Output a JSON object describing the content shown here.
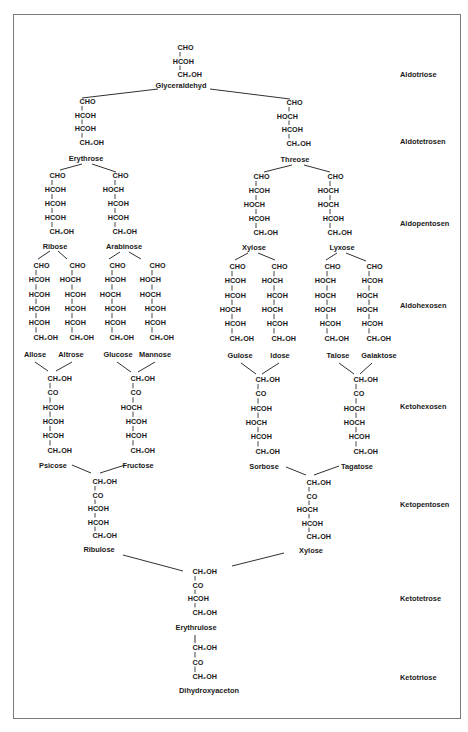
{
  "diagram": {
    "type": "sugar-family-tree",
    "row_labels": {
      "aldotriose": "Aldotriose",
      "aldotetrosen": "Aldotetrosen",
      "aldopentosen": "Aldopentosen",
      "aldohexosen": "Aldohexosen",
      "ketohexosen": "Ketohexosen",
      "ketopentosen": "Ketopentosen",
      "ketotetrose": "Ketotetrose",
      "ketotriose": "Ketotriose"
    },
    "sugars": {
      "glyceraldehyd": {
        "name": "Glyceraldehyd",
        "lines": [
          "CHO",
          "HCOH",
          "CH₂OH"
        ]
      },
      "erythrose": {
        "name": "Erythrose",
        "lines": [
          "CHO",
          "HCOH",
          "HCOH",
          "CH₂OH"
        ]
      },
      "threose": {
        "name": "Threose",
        "lines": [
          "CHO",
          "HOCH",
          "HCOH",
          "CH₂OH"
        ]
      },
      "ribose": {
        "name": "Ribose",
        "lines": [
          "CHO",
          "HCOH",
          "HCOH",
          "HCOH",
          "CH₂OH"
        ]
      },
      "arabinose": {
        "name": "Arabinose",
        "lines": [
          "CHO",
          "HOCH",
          "HCOH",
          "HCOH",
          "CH₂OH"
        ]
      },
      "xylose": {
        "name": "Xylose",
        "lines": [
          "CHO",
          "HCOH",
          "HOCH",
          "HCOH",
          "CH₂OH"
        ]
      },
      "lyxose": {
        "name": "Lyxose",
        "lines": [
          "CHO",
          "HOCH",
          "HOCH",
          "HCOH",
          "CH₂OH"
        ]
      },
      "allose": {
        "name": "Allose",
        "lines": [
          "CHO",
          "HCOH",
          "HCOH",
          "HCOH",
          "HCOH",
          "CH₂OH"
        ]
      },
      "altrose": {
        "name": "Altrose",
        "lines": [
          "CHO",
          "HOCH",
          "HCOH",
          "HCOH",
          "HCOH",
          "CH₂OH"
        ]
      },
      "glucose": {
        "name": "Glucose",
        "lines": [
          "CHO",
          "HCOH",
          "HOCH",
          "HCOH",
          "HCOH",
          "CH₂OH"
        ]
      },
      "mannose": {
        "name": "Mannose",
        "lines": [
          "CHO",
          "HOCH",
          "HOCH",
          "HCOH",
          "HCOH",
          "CH₂OH"
        ]
      },
      "gulose": {
        "name": "Gulose",
        "lines": [
          "CHO",
          "HCOH",
          "HCOH",
          "HOCH",
          "HCOH",
          "CH₂OH"
        ]
      },
      "idose": {
        "name": "Idose",
        "lines": [
          "CHO",
          "HOCH",
          "HCOH",
          "HOCH",
          "HCOH",
          "CH₂OH"
        ]
      },
      "talose": {
        "name": "Talose",
        "lines": [
          "CHO",
          "HOCH",
          "HOCH",
          "HOCH",
          "HCOH",
          "CH₂OH"
        ]
      },
      "galaktose": {
        "name": "Galaktose",
        "lines": [
          "CHO",
          "HCOH",
          "HOCH",
          "HOCH",
          "HCOH",
          "CH₂OH"
        ]
      },
      "psicose": {
        "name": "Psicose",
        "lines": [
          "CH₂OH",
          "CO",
          "HCOH",
          "HCOH",
          "HCOH",
          "CH₂OH"
        ]
      },
      "fructose": {
        "name": "Fructose",
        "lines": [
          "CH₂OH",
          "CO",
          "HOCH",
          "HCOH",
          "HCOH",
          "CH₂OH"
        ]
      },
      "sorbose": {
        "name": "Sorbose",
        "lines": [
          "CH₂OH",
          "CO",
          "HCOH",
          "HOCH",
          "HCOH",
          "CH₂OH"
        ]
      },
      "tagatose": {
        "name": "Tagatose",
        "lines": [
          "CH₂OH",
          "CO",
          "HOCH",
          "HOCH",
          "HCOH",
          "CH₂OH"
        ]
      },
      "ribulose": {
        "name": "Ribulose",
        "lines": [
          "CH₂OH",
          "CO",
          "HCOH",
          "HCOH",
          "CH₂OH"
        ]
      },
      "xylulose": {
        "name": "Xylose",
        "lines": [
          "CH₂OH",
          "CO",
          "HOCH",
          "HCOH",
          "CH₂OH"
        ]
      },
      "erythrulose": {
        "name": "Erythrulose",
        "lines": [
          "CH₂OH",
          "CO",
          "HCOH",
          "CH₂OH"
        ]
      },
      "dihydroxyaceton": {
        "name": "Dihydroxyaceton",
        "lines": [
          "CH₂OH",
          "CO",
          "CH₂OH"
        ]
      }
    }
  }
}
